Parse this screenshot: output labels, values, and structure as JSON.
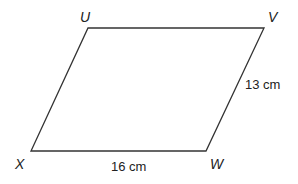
{
  "diagram": {
    "shape": "parallelogram",
    "stroke_color": "#333333",
    "vertices": [
      {
        "label": "U",
        "x": 88,
        "y": 28
      },
      {
        "label": "V",
        "x": 264,
        "y": 28
      },
      {
        "label": "W",
        "x": 206,
        "y": 151
      },
      {
        "label": "X",
        "x": 31,
        "y": 151
      }
    ],
    "side_labels": {
      "XW": "16 cm",
      "WV": "13 cm"
    }
  }
}
